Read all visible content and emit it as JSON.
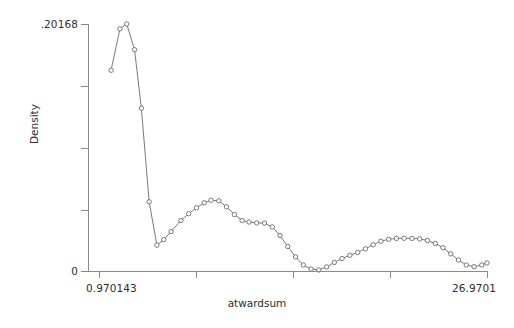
{
  "chart_data": {
    "type": "line",
    "title": "",
    "subtitle": "",
    "xlabel": "atwardsum",
    "ylabel": "Density",
    "grid": false,
    "legend": null,
    "marker": "open-circle",
    "line_color": "#6b6b6b",
    "marker_color": "#6b6b6b",
    "axis_color": "#8a8a8a",
    "xlim": [
      0.970143,
      26.9701
    ],
    "ylim": [
      0,
      0.20168
    ],
    "xticks": [
      0.970143,
      7.470143,
      13.970143,
      20.470143,
      26.9701
    ],
    "xticklabels": [
      "0.970143",
      "",
      "",
      "",
      "26.9701"
    ],
    "yticks": [
      0,
      0.05042,
      0.10084,
      0.15126,
      0.20168
    ],
    "yticklabels": [
      "0",
      "",
      "",
      "",
      ".20168"
    ],
    "series": [
      {
        "name": "Density",
        "x": [
          1.78,
          2.37,
          2.83,
          3.35,
          3.81,
          4.33,
          4.85,
          5.31,
          5.8,
          6.46,
          6.98,
          7.5,
          8.02,
          8.48,
          9.0,
          9.52,
          10.04,
          10.56,
          11.02,
          11.54,
          12.06,
          12.58,
          13.1,
          13.62,
          14.14,
          14.66,
          15.18,
          15.7,
          16.22,
          16.74,
          17.26,
          17.78,
          18.3,
          18.82,
          19.34,
          19.86,
          20.38,
          20.9,
          21.42,
          21.94,
          22.46,
          22.98,
          23.5,
          24.02,
          24.54,
          25.06,
          25.58,
          26.1,
          26.62,
          26.97
        ],
        "y": [
          0.1639,
          0.1977,
          0.2017,
          0.1807,
          0.1329,
          0.0565,
          0.0211,
          0.0256,
          0.0322,
          0.0412,
          0.0468,
          0.0516,
          0.0557,
          0.0578,
          0.0573,
          0.0524,
          0.0461,
          0.0412,
          0.04,
          0.0392,
          0.0391,
          0.036,
          0.029,
          0.02,
          0.0115,
          0.0049,
          0.0016,
          0.0008,
          0.0033,
          0.007,
          0.0102,
          0.0128,
          0.0152,
          0.0181,
          0.0214,
          0.0243,
          0.0259,
          0.0266,
          0.0267,
          0.0266,
          0.0262,
          0.0249,
          0.0225,
          0.019,
          0.014,
          0.009,
          0.0049,
          0.0035,
          0.0049,
          0.0066
        ]
      }
    ]
  },
  "axes": {
    "x_title": "atwardsum",
    "y_title": "Density",
    "x_min_label": "0.970143",
    "x_max_label": "26.9701",
    "y_min_label": "0",
    "y_max_label": ".20168"
  }
}
